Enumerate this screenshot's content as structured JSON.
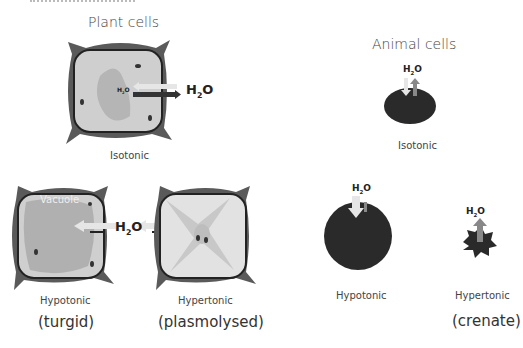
{
  "plant": {
    "title": "Plant cells",
    "isotonic": {
      "label": "Isotonic",
      "h2o_big": "H",
      "h2o_small": "H"
    },
    "hypotonic": {
      "label": "Hypotonic",
      "state": "(turgid)",
      "vacuole": "Vacuole"
    },
    "hypertonic": {
      "label": "Hypertonic",
      "state": "(plasmolysed)"
    },
    "h2o_between": "H"
  },
  "animal": {
    "title": "Animal cells",
    "isotonic": {
      "label": "Isotonic"
    },
    "hypotonic": {
      "label": "Hypotonic"
    },
    "hypertonic": {
      "label": "Hypertonic",
      "state": "(crenate)"
    }
  },
  "water": {
    "h": "H",
    "sub": "2",
    "o": "O"
  },
  "colors": {
    "cell_wall": "#5a5a5a",
    "cytoplasm": "#cfcfcf",
    "vacuole": "#b8b8b8",
    "animal_cell": "#2a2a2a",
    "arrow_light": "#e6e6e6",
    "arrow_dark": "#333333"
  }
}
